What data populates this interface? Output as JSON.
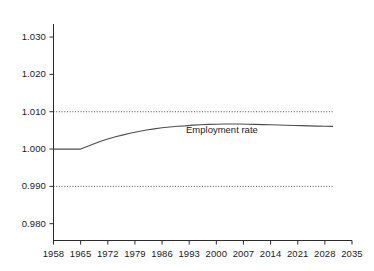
{
  "chart_data": {
    "type": "line",
    "title": "",
    "xlabel": "",
    "ylabel": "",
    "xlim": [
      1958,
      2035
    ],
    "ylim": [
      0.9755,
      1.0335
    ],
    "grid": false,
    "legend_position": "inline-annotation",
    "y_ticks": [
      "1.030",
      "1.020",
      "1.010",
      "1.000",
      "0.990",
      "0.980"
    ],
    "y_tick_values": [
      1.03,
      1.02,
      1.01,
      1.0,
      0.99,
      0.98
    ],
    "x_ticks": [
      "1958",
      "1965",
      "1972",
      "1979",
      "1986",
      "1993",
      "2000",
      "2007",
      "2014",
      "2021",
      "2028",
      "2035"
    ],
    "x_tick_values": [
      1958,
      1965,
      1972,
      1979,
      1986,
      1993,
      2000,
      2007,
      2014,
      2021,
      2028,
      2035
    ],
    "reference_lines": [
      {
        "label": "upper-band",
        "value": 1.01,
        "style": "dotted"
      },
      {
        "label": "lower-band",
        "value": 0.99,
        "style": "dotted"
      }
    ],
    "series": [
      {
        "name": "Employment rate",
        "annotation": "Employment rate",
        "color": "#4d4d4d",
        "x": [
          1958,
          1960,
          1962,
          1964,
          1965,
          1966,
          1967,
          1968,
          1969,
          1970,
          1972,
          1974,
          1976,
          1978,
          1980,
          1982,
          1984,
          1986,
          1988,
          1990,
          1992,
          1994,
          1996,
          1998,
          2000,
          2002,
          2004,
          2006,
          2008,
          2010,
          2012,
          2014,
          2016,
          2018,
          2020,
          2022,
          2024,
          2026,
          2028,
          2030
        ],
        "values": [
          1.0,
          1.0,
          1.0,
          1.0,
          1.0,
          1.0004,
          1.0008,
          1.0012,
          1.0016,
          1.002,
          1.0027,
          1.0033,
          1.0038,
          1.0043,
          1.0047,
          1.0051,
          1.0054,
          1.0057,
          1.0059,
          1.0061,
          1.0062,
          1.0064,
          1.0065,
          1.0066,
          1.00665,
          1.0067,
          1.0067,
          1.0067,
          1.00665,
          1.0066,
          1.00655,
          1.0065,
          1.00645,
          1.00638,
          1.00632,
          1.00626,
          1.0062,
          1.00615,
          1.0061,
          1.00608
        ]
      }
    ]
  },
  "axes": {
    "y_axis_name": "value-axis",
    "x_axis_name": "year-axis"
  }
}
